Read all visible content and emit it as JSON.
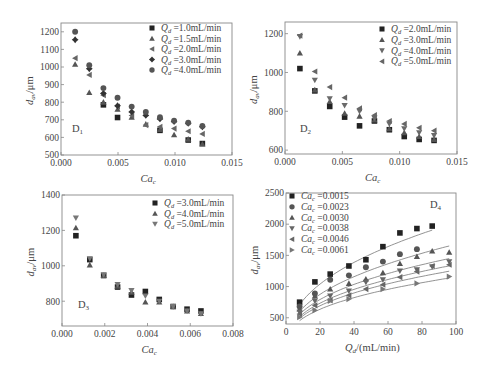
{
  "figure": {
    "width": 485,
    "height": 370
  },
  "colors": {
    "axis": "#888888",
    "text": "#444444",
    "dark": "#222222",
    "mid": "#555555",
    "light": "#777777",
    "fit": "#777777"
  },
  "chart_data": [
    {
      "id": "D1",
      "type": "scatter",
      "panel_label": "D1",
      "xlabel": "Ca_c",
      "ylabel": "d_av/μm",
      "xlim": [
        0,
        0.015
      ],
      "ylim": [
        500,
        1250
      ],
      "xticks": [
        0,
        0.005,
        0.01,
        0.015
      ],
      "xtick_labels": [
        "0.000",
        "0.005",
        "0.010",
        "0.015"
      ],
      "yticks": [
        500,
        600,
        700,
        800,
        900,
        1000,
        1100,
        1200
      ],
      "ytick_labels": [
        "500",
        "600",
        "700",
        "800",
        "900",
        "1000",
        "1100",
        "1200"
      ],
      "frame": {
        "left": 61,
        "right": 232,
        "top": 23,
        "bottom": 155
      },
      "legend": {
        "x": 152,
        "y": 31,
        "dy": 10.5,
        "position": "upper right"
      },
      "label_pos": {
        "x": 72,
        "y": 132
      },
      "x": [
        0.00124,
        0.00248,
        0.00372,
        0.00496,
        0.0062,
        0.00744,
        0.00868,
        0.00992,
        0.01116,
        0.0124
      ],
      "series": [
        {
          "name": "Qd=1.0mL/min",
          "sub": "d",
          "value": "=1.0mL/min",
          "marker": "square",
          "color": "#222222",
          "values": [
            null,
            null,
            785,
            713,
            null,
            null,
            640,
            null,
            585,
            565
          ]
        },
        {
          "name": "Qd=1.5mL/min",
          "sub": "d",
          "value": "=1.5mL/min",
          "marker": "triangle-up",
          "color": "#555555",
          "values": [
            1015,
            855,
            800,
            760,
            715,
            675,
            645,
            615,
            590,
            562
          ]
        },
        {
          "name": "Qd=2.0mL/min",
          "sub": "d",
          "value": "=2.0mL/min",
          "marker": "triangle-left",
          "color": "#666666",
          "values": [
            1050,
            955,
            840,
            775,
            725,
            670,
            660,
            650,
            635,
            620
          ]
        },
        {
          "name": "Qd=3.0mL/min",
          "sub": "d",
          "value": "=3.0mL/min",
          "marker": "diamond-plus",
          "color": "#333333",
          "values": [
            1155,
            990,
            850,
            780,
            745,
            725,
            705,
            690,
            680,
            660
          ]
        },
        {
          "name": "Qd=4.0mL/min",
          "sub": "d",
          "value": "=4.0mL/min",
          "marker": "circle",
          "color": "#555555",
          "values": [
            1200,
            1010,
            880,
            825,
            775,
            745,
            715,
            695,
            683,
            665
          ]
        }
      ]
    },
    {
      "id": "D2",
      "type": "scatter",
      "panel_label": "D2",
      "xlabel": "Ca_c",
      "ylabel": "d_av/μm",
      "xlim": [
        0,
        0.015
      ],
      "ylim": [
        580,
        1260
      ],
      "xticks": [
        0,
        0.005,
        0.01,
        0.015
      ],
      "xtick_labels": [
        "0.000",
        "0.005",
        "0.010",
        "0.015"
      ],
      "yticks": [
        600,
        800,
        1000,
        1200
      ],
      "ytick_labels": [
        "600",
        "800",
        "1000",
        "1200"
      ],
      "frame": {
        "left": 285,
        "right": 457,
        "top": 22,
        "bottom": 154
      },
      "legend": {
        "x": 382,
        "y": 32,
        "dy": 10.8,
        "position": "upper right"
      },
      "label_pos": {
        "x": 300,
        "y": 132
      },
      "x": [
        0.0013,
        0.0026,
        0.0039,
        0.0052,
        0.0065,
        0.0078,
        0.0091,
        0.0104,
        0.0117,
        0.013
      ],
      "series": [
        {
          "name": "Qd=2.0mL/min",
          "sub": "d",
          "value": "=2.0mL/min",
          "marker": "square",
          "color": "#222222",
          "values": [
            1020,
            905,
            825,
            770,
            725,
            750,
            705,
            670,
            655,
            650
          ]
        },
        {
          "name": "Qd=3.0mL/min",
          "sub": "d",
          "value": "=3.0mL/min",
          "marker": "triangle-up",
          "color": "#555555",
          "values": [
            1100,
            910,
            850,
            790,
            775,
            755,
            710,
            690,
            670,
            655
          ]
        },
        {
          "name": "Qd=4.0mL/min",
          "sub": "d",
          "value": "=4.0mL/min",
          "marker": "triangle-down",
          "color": "#6a6a6a",
          "values": [
            1185,
            960,
            865,
            830,
            800,
            765,
            735,
            710,
            690,
            675
          ]
        },
        {
          "name": "Qd=5.0mL/min",
          "sub": "d",
          "value": "=5.0mL/min",
          "marker": "triangle-left",
          "color": "#666666",
          "values": [
            1190,
            1005,
            925,
            870,
            815,
            780,
            750,
            735,
            715,
            700
          ]
        }
      ]
    },
    {
      "id": "D3",
      "type": "scatter",
      "panel_label": "D3",
      "xlabel": "Ca_c",
      "ylabel": "d_av/μm",
      "xlim": [
        0,
        0.008
      ],
      "ylim": [
        660,
        1400
      ],
      "xticks": [
        0,
        0.002,
        0.004,
        0.006,
        0.008
      ],
      "xtick_labels": [
        "0.000",
        "0.002",
        "0.004",
        "0.006",
        "0.008"
      ],
      "yticks": [
        800,
        1000,
        1200,
        1400
      ],
      "ytick_labels": [
        "800",
        "1000",
        "1200",
        "1400"
      ],
      "frame": {
        "left": 62,
        "right": 233,
        "top": 195,
        "bottom": 326
      },
      "legend": {
        "x": 155,
        "y": 206,
        "dy": 10.5,
        "position": "upper right"
      },
      "label_pos": {
        "x": 78,
        "y": 308
      },
      "x": [
        0.00065,
        0.0013,
        0.00195,
        0.0026,
        0.00325,
        0.0039,
        0.00455,
        0.0052,
        0.00585,
        0.0065
      ],
      "series": [
        {
          "name": "Qd=3.0mL/min",
          "sub": "d",
          "value": "=3.0mL/min",
          "marker": "square",
          "color": "#222222",
          "values": [
            1170,
            1035,
            945,
            880,
            835,
            855,
            810,
            770,
            755,
            745
          ]
        },
        {
          "name": "Qd=4.0mL/min",
          "sub": "d",
          "value": "=4.0mL/min",
          "marker": "triangle-up",
          "color": "#555555",
          "values": [
            1215,
            1005,
            945,
            885,
            850,
            795,
            795,
            770,
            745,
            730
          ]
        },
        {
          "name": "Qd=5.0mL/min",
          "sub": "d",
          "value": "=5.0mL/min",
          "marker": "triangle-down",
          "color": "#777777",
          "values": [
            1270,
            1040,
            950,
            895,
            860,
            830,
            800,
            770,
            745,
            730
          ]
        }
      ]
    },
    {
      "id": "D4",
      "type": "scatter",
      "panel_label": "D4",
      "xlabel": "Qd/(mL/min)",
      "ylabel": "d_av/μm",
      "xlim": [
        0,
        100
      ],
      "ylim": [
        400,
        2500
      ],
      "xticks": [
        0,
        20,
        40,
        60,
        80,
        100
      ],
      "xtick_labels": [
        "0",
        "20",
        "40",
        "60",
        "80",
        "100"
      ],
      "yticks": [
        500,
        1000,
        1500,
        2000,
        2500
      ],
      "ytick_labels": [
        "500",
        "1000",
        "1500",
        "2000",
        "2500"
      ],
      "frame": {
        "left": 286,
        "right": 456,
        "top": 193,
        "bottom": 324
      },
      "legend": {
        "x": 292,
        "y": 199,
        "dy": 10.8,
        "position": "upper left"
      },
      "label_pos": {
        "x": 430,
        "y": 208
      },
      "x": [
        8,
        17,
        26,
        37,
        47,
        57,
        67,
        77,
        86,
        96
      ],
      "fit_curves": true,
      "series": [
        {
          "name": "Cac=0.0015",
          "sub": "c",
          "value": "=0.0015",
          "marker": "square",
          "color": "#222222",
          "values": [
            750,
            1075,
            1200,
            1330,
            1430,
            1640,
            1860,
            1930,
            1970,
            null
          ],
          "fit": {
            "a": 300,
            "b": 0.415
          }
        },
        {
          "name": "Cac=0.0023",
          "sub": "c",
          "value": "=0.0023",
          "marker": "circle",
          "color": "#555555",
          "values": [
            680,
            890,
            1110,
            1180,
            1310,
            1400,
            1520,
            1600,
            null,
            null
          ],
          "fit": {
            "a": 260,
            "b": 0.405
          }
        },
        {
          "name": "Cac=0.0030",
          "sub": "c",
          "value": "=0.0030",
          "marker": "triangle-up",
          "color": "#555555",
          "values": [
            640,
            850,
            960,
            1050,
            1120,
            1220,
            1370,
            1480,
            1570,
            1550
          ],
          "fit": {
            "a": 250,
            "b": 0.385
          }
        },
        {
          "name": "Cac=0.0038",
          "sub": "c",
          "value": "=0.0038",
          "marker": "triangle-down",
          "color": "#666666",
          "values": [
            590,
            770,
            850,
            930,
            1070,
            1110,
            1250,
            1270,
            1320,
            1400
          ],
          "fit": {
            "a": 235,
            "b": 0.38
          }
        },
        {
          "name": "Cac=0.0046",
          "sub": "c",
          "value": "=0.0046",
          "marker": "triangle-left",
          "color": "#666666",
          "values": [
            560,
            700,
            780,
            860,
            960,
            1030,
            1150,
            1240,
            1330,
            1350
          ],
          "fit": {
            "a": 225,
            "b": 0.375
          }
        },
        {
          "name": "Cac=0.0061",
          "sub": "c",
          "value": "=0.0061",
          "marker": "triangle-right",
          "color": "#777777",
          "values": [
            510,
            620,
            770,
            800,
            null,
            960,
            null,
            1050,
            null,
            1160
          ],
          "fit": {
            "a": 210,
            "b": 0.37
          }
        }
      ]
    }
  ]
}
